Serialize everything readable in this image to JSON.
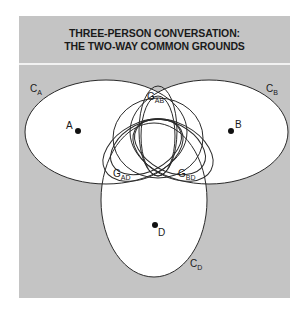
{
  "title": {
    "line1": "THREE-PERSON CONVERSATION:",
    "line2": "THE TWO-WAY COMMON GROUNDS"
  },
  "colors": {
    "panel_bg": "#c4c4c4",
    "region_fill": "#ffffff",
    "stroke": "#2a2a2a",
    "text": "#1a1a1a"
  },
  "persons": [
    {
      "id": "A",
      "label": "A"
    },
    {
      "id": "B",
      "label": "B"
    },
    {
      "id": "D",
      "label": "D"
    }
  ],
  "contexts": [
    {
      "id": "CA",
      "main": "C",
      "sub": "A"
    },
    {
      "id": "CB",
      "main": "C",
      "sub": "B"
    },
    {
      "id": "CD",
      "main": "C",
      "sub": "D"
    }
  ],
  "common_grounds": [
    {
      "id": "GAB",
      "main": "G",
      "sub": "AB"
    },
    {
      "id": "GAD",
      "main": "G",
      "sub": "AD"
    },
    {
      "id": "GBD",
      "main": "G",
      "sub": "BD"
    }
  ]
}
